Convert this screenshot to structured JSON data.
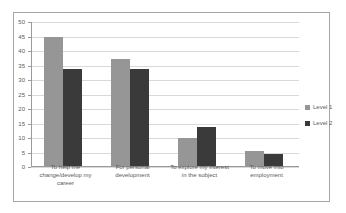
{
  "chart_data": {
    "type": "bar",
    "title": "",
    "xlabel": "",
    "ylabel": "",
    "ylim": [
      0,
      50
    ],
    "ytick_step": 5,
    "yticks": [
      50,
      45,
      40,
      35,
      30,
      25,
      20,
      15,
      10,
      5,
      0
    ],
    "grid": true,
    "legend_position": "right",
    "categories": [
      "To help me\nchange/develop my\ncareer",
      "For personal\ndevelopment",
      "To explore my interest\nin the subject",
      "To move into\nemployment"
    ],
    "series": [
      {
        "name": "Level 1",
        "color": "#969696",
        "values": [
          44.5,
          37.0,
          9.7,
          5.3
        ]
      },
      {
        "name": "Level 2",
        "color": "#3a3a3a",
        "values": [
          33.3,
          33.5,
          13.5,
          4.3
        ]
      }
    ]
  },
  "legend": {
    "entries": [
      {
        "label": "Level 1",
        "color": "#969696"
      },
      {
        "label": "Level 2",
        "color": "#3a3a3a"
      }
    ]
  },
  "style": {
    "border_color": "#a6a6a6",
    "gridline_color": "#d9d9d9",
    "axis_color": "#9a9a9a",
    "tick_text_color": "#5a5a5a",
    "background": "#ffffff"
  }
}
